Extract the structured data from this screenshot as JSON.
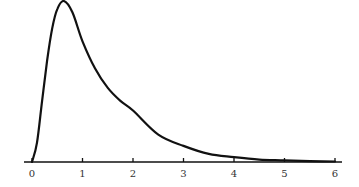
{
  "chart_data": {
    "type": "line",
    "title": "",
    "xlabel": "",
    "ylabel": "",
    "xlim": [
      0,
      6
    ],
    "ylim": [
      0,
      1
    ],
    "grid": false,
    "legend": null,
    "x_ticks": [
      "0",
      "1",
      "2",
      "3",
      "4",
      "5",
      "6"
    ],
    "series": [
      {
        "name": "density",
        "x": [
          0,
          0.1,
          0.2,
          0.3,
          0.4,
          0.5,
          0.63,
          0.8,
          1.0,
          1.25,
          1.5,
          1.75,
          2.0,
          2.5,
          3.0,
          3.5,
          4.0,
          4.5,
          5.0,
          5.5,
          6.0
        ],
        "values": [
          0,
          0.12,
          0.38,
          0.63,
          0.83,
          0.95,
          1.0,
          0.93,
          0.75,
          0.58,
          0.46,
          0.38,
          0.32,
          0.17,
          0.1,
          0.05,
          0.03,
          0.015,
          0.01,
          0.005,
          0.003
        ]
      }
    ]
  },
  "colors": {
    "line": "#111111",
    "axis": "#111111",
    "text": "#333333",
    "background": "#ffffff"
  }
}
